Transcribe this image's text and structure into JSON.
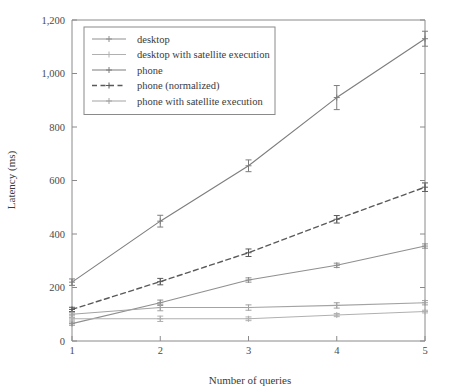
{
  "chart_data": {
    "type": "line",
    "title": "",
    "xlabel": "Number of queries",
    "ylabel": "Latency (ms)",
    "x": [
      1,
      2,
      3,
      4,
      5
    ],
    "xlim": [
      1,
      5
    ],
    "ylim": [
      0,
      1200
    ],
    "xticks": [
      "1",
      "2",
      "3",
      "4",
      "5"
    ],
    "yticks": [
      "0",
      "200",
      "400",
      "600",
      "800",
      "1,000",
      "1,200"
    ],
    "ytick_values": [
      0,
      200,
      400,
      600,
      800,
      1000,
      1200
    ],
    "grid": false,
    "legend_position": "upper-left-inside",
    "series": [
      {
        "name": "desktop",
        "style": "solid",
        "marker": "plus",
        "color": "#8f8f8f",
        "values": [
          65,
          143,
          228,
          283,
          355
        ],
        "errors": [
          6,
          10,
          8,
          8,
          8
        ]
      },
      {
        "name": "desktop with satellite execution",
        "style": "solid",
        "marker": "plus",
        "color": "#b0b0b0",
        "values": [
          83,
          83,
          83,
          97,
          110
        ],
        "errors": [
          5,
          10,
          7,
          6,
          5
        ]
      },
      {
        "name": "phone",
        "style": "solid",
        "marker": "plus",
        "color": "#7d7d7d",
        "values": [
          220,
          448,
          655,
          910,
          1130
        ],
        "errors": [
          12,
          22,
          22,
          45,
          28
        ]
      },
      {
        "name": "phone (normalized)",
        "style": "dashed",
        "marker": "plus",
        "color": "#5a5a5a",
        "values": [
          118,
          222,
          330,
          455,
          575
        ],
        "errors": [
          8,
          12,
          14,
          14,
          16
        ]
      },
      {
        "name": "phone with satellite execution",
        "style": "solid",
        "marker": "plus",
        "color": "#a3a3a3",
        "values": [
          100,
          125,
          125,
          133,
          143
        ],
        "errors": [
          6,
          12,
          10,
          10,
          8
        ]
      }
    ]
  },
  "legend": {
    "entries": [
      "desktop",
      "desktop with satellite execution",
      "phone",
      "phone (normalized)",
      "phone with satellite execution"
    ]
  },
  "axes": {
    "y_title": "Latency (ms)",
    "x_title": "Number of queries"
  }
}
